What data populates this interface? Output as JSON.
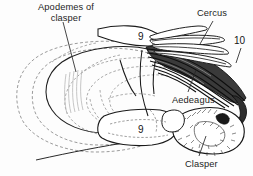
{
  "figure": {
    "type": "scientific-line-drawing",
    "background_color": "#fdfdfd",
    "ink_color": "#1a1a1a",
    "dashed_color": "#9a9a9a",
    "labels": [
      {
        "id": "apodemes",
        "text_line1": "Apodemes of",
        "text_line2": "clasper",
        "x": 34,
        "y": 3,
        "leader": true
      },
      {
        "id": "cercus",
        "text_line1": "Cercus",
        "text_line2": "",
        "x": 198,
        "y": 9,
        "leader": true
      },
      {
        "id": "aedeagus",
        "text_line1": "Aedeagus",
        "text_line2": "",
        "x": 172,
        "y": 96,
        "leader": true
      },
      {
        "id": "clasper",
        "text_line1": "Clasper",
        "text_line2": "",
        "x": 186,
        "y": 160,
        "leader": true
      }
    ],
    "segment_numbers": [
      {
        "id": "nine-upper",
        "value": "9",
        "x": 139,
        "y": 33
      },
      {
        "id": "nine-lower",
        "value": "9",
        "x": 139,
        "y": 125
      },
      {
        "id": "ten",
        "value": "10",
        "x": 235,
        "y": 36
      }
    ]
  }
}
